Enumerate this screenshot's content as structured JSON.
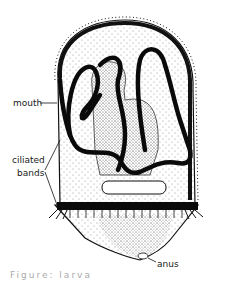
{
  "figure": {
    "labels": {
      "mouth": "mouth",
      "ciliated_bands_line1": "ciliated",
      "ciliated_bands_line2": "bands",
      "anus": "anus"
    },
    "caption_partial": "Figure: larva"
  },
  "colors": {
    "ink": "#111111",
    "background": "#ffffff",
    "stipple": "#333333"
  }
}
